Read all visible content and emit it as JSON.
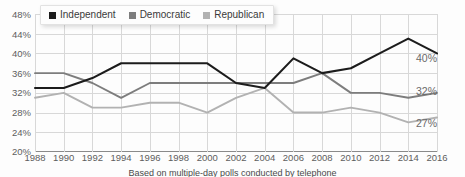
{
  "chart_data": {
    "type": "line",
    "title": "",
    "xlabel": "",
    "ylabel": "",
    "ylim": [
      20,
      48
    ],
    "ytick_step": 4,
    "grid": true,
    "legend_position": "top-left",
    "categories": [
      1988,
      1990,
      1992,
      1994,
      1996,
      1998,
      2000,
      2002,
      2004,
      2006,
      2008,
      2010,
      2012,
      2014,
      2016
    ],
    "ytick_labels": [
      "20%",
      "24%",
      "28%",
      "32%",
      "36%",
      "40%",
      "44%",
      "48%"
    ],
    "xtick_labels": [
      "1988",
      "1990",
      "1992",
      "1994",
      "1996",
      "1998",
      "2000",
      "2002",
      "2004",
      "2006",
      "2008",
      "2010",
      "2012",
      "2014",
      "2016"
    ],
    "series": [
      {
        "name": "Independent",
        "color": "#1c1c1c",
        "end_label": "40%",
        "values": [
          33,
          33,
          35,
          38,
          38,
          38,
          38,
          34,
          33,
          39,
          36,
          37,
          40,
          43,
          40
        ]
      },
      {
        "name": "Democratic",
        "color": "#7d7d7d",
        "end_label": "32%",
        "values": [
          36,
          36,
          34,
          31,
          34,
          34,
          34,
          34,
          34,
          34,
          36,
          32,
          32,
          31,
          32
        ]
      },
      {
        "name": "Republican",
        "color": "#b2b2b2",
        "end_label": "27%",
        "values": [
          31,
          32,
          29,
          29,
          30,
          30,
          28,
          31,
          33,
          28,
          28,
          29,
          28,
          26,
          27
        ]
      }
    ]
  },
  "legend": {
    "items": [
      {
        "label": "Independent"
      },
      {
        "label": "Democratic"
      },
      {
        "label": "Republican"
      }
    ]
  },
  "caption": {
    "text": "Based on multiple-day polls conducted by telephone"
  }
}
